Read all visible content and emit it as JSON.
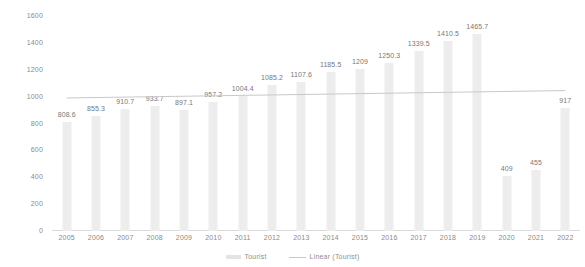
{
  "chart_data": {
    "type": "bar",
    "title": "",
    "subtitle": "",
    "xlabel": "",
    "ylabel": "",
    "grid": false,
    "legend_position": "bottom",
    "ylim": [
      0,
      1600
    ],
    "yticks": [
      0,
      200,
      400,
      600,
      800,
      1000,
      1200,
      1400,
      1600
    ],
    "ytick_labels": [
      "0",
      "200",
      "400",
      "600",
      "800",
      "1000",
      "1200",
      "1400",
      "1600"
    ],
    "categories": [
      "2005",
      "2006",
      "2007",
      "2008",
      "2009",
      "2010",
      "2011",
      "2012",
      "2013",
      "2014",
      "2015",
      "2016",
      "2017",
      "2018",
      "2019",
      "2020",
      "2021",
      "2022"
    ],
    "series": [
      {
        "name": "Tourist",
        "type": "bar",
        "color": "#ededed",
        "values": [
          808.6,
          855.3,
          910.7,
          933.7,
          897.1,
          957.2,
          1004.4,
          1085.2,
          1107.6,
          1185.5,
          1209,
          1250.3,
          1339.5,
          1410.5,
          1465.7,
          409,
          455,
          917
        ],
        "data_labels": [
          "808.6",
          "855.3",
          "910.7",
          "933.7",
          "897.1",
          "957.2",
          "1004.4",
          "1085.2",
          "1107.6",
          "1185.5",
          "1209",
          "1250.3",
          "1339.5",
          "1410.5",
          "1465.7",
          "409",
          "455",
          "917"
        ]
      },
      {
        "name": "Linear (Tourist)",
        "type": "line",
        "color": "#c8c8c8",
        "trendline": true,
        "start_value": 990,
        "end_value": 1045
      }
    ]
  },
  "legend": {
    "items": [
      {
        "label": "Tourist",
        "marker": "bar-swatch"
      },
      {
        "label": "Linear (Tourist)",
        "marker": "line-swatch"
      }
    ]
  }
}
